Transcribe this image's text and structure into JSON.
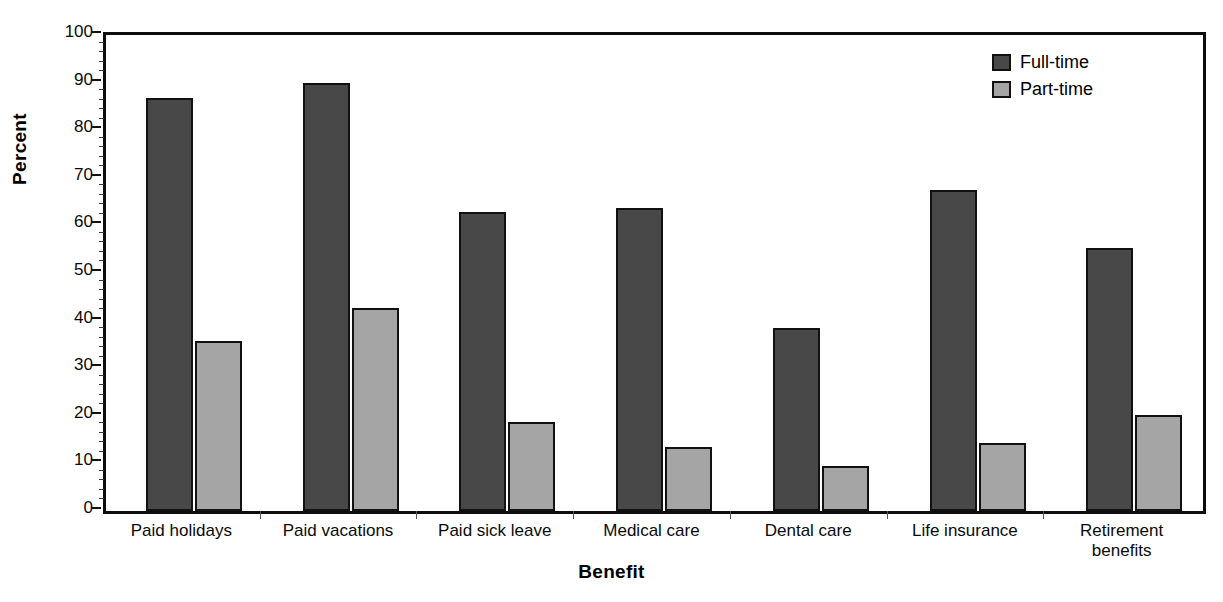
{
  "chart_data": {
    "type": "bar",
    "title": "",
    "subtitle": "",
    "xlabel": "Benefit",
    "ylabel": "Percent",
    "ylim": [
      0,
      100
    ],
    "ytick_step": 10,
    "yticks": [
      0,
      10,
      20,
      30,
      40,
      50,
      60,
      70,
      80,
      90,
      100
    ],
    "ytick_labels": [
      "0",
      "10",
      "20",
      "30",
      "40",
      "50",
      "60",
      "70",
      "80",
      "90",
      "100"
    ],
    "grid": false,
    "legend_position": "top-right",
    "categories": [
      "Paid holidays",
      "Paid vacations",
      "Paid sick leave",
      "Medical care",
      "Dental care",
      "Life insurance",
      "Retirement benefits"
    ],
    "category_lines": [
      [
        "Paid holidays"
      ],
      [
        "Paid vacations"
      ],
      [
        "Paid sick leave"
      ],
      [
        "Medical care"
      ],
      [
        "Dental care"
      ],
      [
        "Life insurance"
      ],
      [
        "Retirement",
        "benefits"
      ]
    ],
    "series": [
      {
        "name": "Full-time",
        "color": "#484848",
        "values": [
          86.8,
          89.9,
          62.8,
          63.7,
          38.5,
          67.5,
          55.2
        ]
      },
      {
        "name": "Part-time",
        "color": "#a5a5a5",
        "values": [
          35.8,
          42.7,
          18.7,
          13.4,
          9.4,
          14.3,
          20.2
        ]
      }
    ]
  },
  "legend": {
    "entries": [
      {
        "label": "Full-time",
        "swatch": "full"
      },
      {
        "label": "Part-time",
        "swatch": "part"
      }
    ]
  },
  "colors": {
    "full_time": "#484848",
    "part_time": "#a5a5a5",
    "axis": "#111111",
    "background": "#ffffff"
  }
}
